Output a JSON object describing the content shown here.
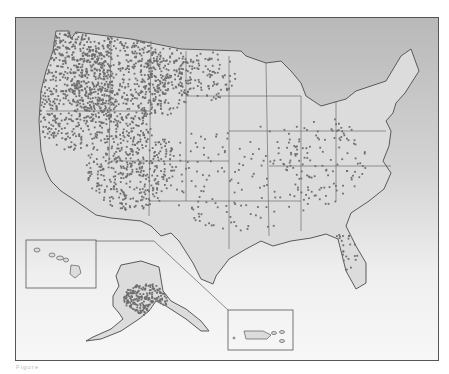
{
  "map": {
    "type": "dot-density choropleth-outline",
    "subject": "United States dot distribution",
    "colors": {
      "land": "#dcdcdc",
      "border": "#5a5a5a",
      "dot": "#6e6e6e",
      "frame": "#555555",
      "background_top": "#b9b9b9",
      "background_bottom": "#f7f7f7"
    },
    "frame": {
      "x": 15,
      "y": 17,
      "width": 424,
      "height": 344
    },
    "regions": [
      {
        "name": "contiguous-us",
        "density": "high-west-low-east"
      },
      {
        "name": "alaska",
        "inset": true,
        "density": "high-interior"
      },
      {
        "name": "hawaii",
        "inset": true,
        "density": "none"
      },
      {
        "name": "puerto-rico",
        "inset": true,
        "density": "none"
      }
    ],
    "insets": [
      {
        "name": "hawaii-inset",
        "x": 25,
        "y": 239,
        "width": 70,
        "height": 48
      },
      {
        "name": "puerto-rico-inset",
        "x": 227,
        "y": 309,
        "width": 65,
        "height": 40
      }
    ],
    "dot_clusters": [
      {
        "cx": 70,
        "cy": 90,
        "rx": 42,
        "ry": 60,
        "count": 700
      },
      {
        "cx": 120,
        "cy": 80,
        "rx": 50,
        "ry": 45,
        "count": 520
      },
      {
        "cx": 130,
        "cy": 165,
        "rx": 45,
        "ry": 45,
        "count": 420
      },
      {
        "cx": 165,
        "cy": 80,
        "rx": 25,
        "ry": 35,
        "count": 160
      },
      {
        "cx": 205,
        "cy": 75,
        "rx": 30,
        "ry": 25,
        "count": 110
      },
      {
        "cx": 240,
        "cy": 175,
        "rx": 80,
        "ry": 55,
        "count": 150
      },
      {
        "cx": 320,
        "cy": 160,
        "rx": 45,
        "ry": 45,
        "count": 110
      },
      {
        "cx": 345,
        "cy": 250,
        "rx": 12,
        "ry": 25,
        "count": 40
      },
      {
        "cx": 145,
        "cy": 298,
        "rx": 22,
        "ry": 16,
        "count": 240
      }
    ]
  },
  "caption": "Figure"
}
